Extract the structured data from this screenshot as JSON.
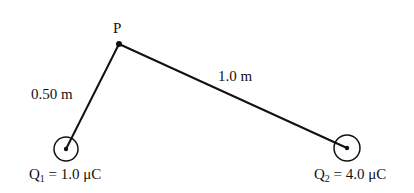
{
  "diagram": {
    "point_p": {
      "label": "P",
      "x": 119,
      "y": 44
    },
    "charges": [
      {
        "symbol": "Q",
        "subscript": "1",
        "equals": " = ",
        "value": "1.0 μC",
        "cx": 66,
        "cy": 149,
        "r": 12
      },
      {
        "symbol": "Q",
        "subscript": "2",
        "equals": " = ",
        "value": "4.0 μC",
        "cx": 347,
        "cy": 148,
        "r": 13
      }
    ],
    "segments": [
      {
        "from": "P",
        "to": "Q1",
        "length_label": "0.50 m"
      },
      {
        "from": "P",
        "to": "Q2",
        "length_label": "1.0 m"
      }
    ],
    "colors": {
      "stroke": "#111111",
      "background": "#ffffff"
    }
  }
}
